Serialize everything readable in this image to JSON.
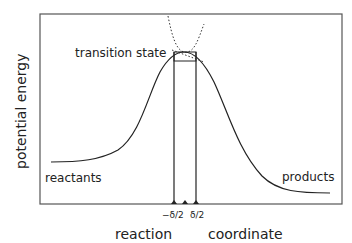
{
  "diagram": {
    "ylabel": "potential energy",
    "xlabel_1": "reaction",
    "xlabel_2": "coordinate",
    "labels": {
      "transition_state": "transition state",
      "reactants": "reactants",
      "products": "products",
      "minus_delta_half": "−δ/2",
      "plus_delta_half": "δ/2"
    },
    "colors": {
      "line": "#222222",
      "frame": "#555555",
      "background": "#ffffff"
    }
  }
}
